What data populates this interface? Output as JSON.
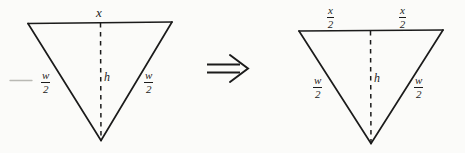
{
  "figure": {
    "background_color": "#fbfbf9",
    "ink_color": "#1b1b1b",
    "implication_symbol": "⇒",
    "left_triangle": {
      "name": "isosceles-triangle-unsplit",
      "top_label": "x",
      "height_label": "h",
      "left_side_numerator": "w",
      "left_side_denominator": "2",
      "right_side_numerator": "w",
      "right_side_denominator": "2",
      "leader_dash": "—"
    },
    "right_triangle": {
      "name": "isosceles-triangle-split",
      "top_left_numerator": "x",
      "top_left_denominator": "2",
      "top_right_numerator": "x",
      "top_right_denominator": "2",
      "height_label": "h",
      "left_side_numerator": "w",
      "left_side_denominator": "2",
      "right_side_numerator": "w",
      "right_side_denominator": "2"
    }
  }
}
